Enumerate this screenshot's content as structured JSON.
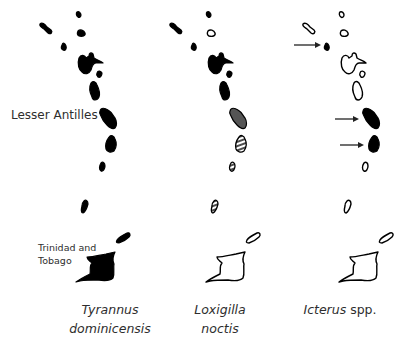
{
  "figure": {
    "region_label": "Lesser Antilles",
    "trinidad_label_line1": "Trinidad and",
    "trinidad_label_line2": "Tobago",
    "legend_states": {
      "filled": "#000000",
      "gray": "#555555",
      "outline": "#ffffff",
      "hatched": "striped"
    },
    "panels": [
      {
        "taxon_line1": "Tyrannus",
        "taxon_line2": "dominicensis",
        "island_states": [
          "filled",
          "filled",
          "filled",
          "filled",
          "filled",
          "filled",
          "filled",
          "filled",
          "filled",
          "filled",
          "filled",
          "filled",
          "filled"
        ],
        "arrows": []
      },
      {
        "taxon_line1": "Loxigilla",
        "taxon_line2": "noctis",
        "island_states": [
          "filled",
          "filled",
          "outline",
          "filled",
          "filled",
          "filled",
          "filled",
          "gray",
          "hatched",
          "hatched",
          "hatched",
          "outline",
          "outline"
        ],
        "arrows": []
      },
      {
        "taxon_italic": "Icterus",
        "taxon_normal": " spp.",
        "island_states": [
          "outline",
          "outline",
          "outline",
          "filled",
          "outline",
          "outline",
          "outline",
          "filled",
          "filled",
          "outline",
          "outline",
          "outline",
          "outline"
        ],
        "arrows": [
          "island-4",
          "island-8",
          "island-9"
        ]
      }
    ],
    "island_order": [
      "north-diagonal",
      "north-small",
      "north-round",
      "west-small",
      "guadeloupe",
      "marie-galante",
      "dominica",
      "martinique",
      "st-lucia",
      "st-vincent",
      "grenada",
      "tobago",
      "trinidad"
    ]
  }
}
